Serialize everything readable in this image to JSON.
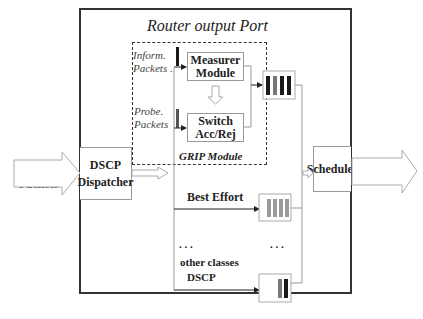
{
  "title": "Router output Port",
  "grip_module_label": "GRIP Module",
  "incoming": {
    "line1": "Incoming",
    "line2": "Packets"
  },
  "dispatcher": {
    "line1": "DSCP",
    "line2": "Dispatcher"
  },
  "measurer": {
    "line1": "Measurer",
    "line2": "Module"
  },
  "switch": {
    "line1": "Switch",
    "line2": "Acc/Rej"
  },
  "inform_packets": {
    "line1": "Inform.",
    "line2": "Packets ."
  },
  "probe_packets": {
    "line1": "Probe.",
    "line2": "Packets"
  },
  "scheduler": "Scheduler",
  "best_effort": "Best Effort",
  "ellipsis_left": ". . .",
  "ellipsis_right": ". . .",
  "other_classes": {
    "line1": "other classes",
    "line2": "DSCP"
  },
  "colors": {
    "queue_dark": "#1a1a1a",
    "queue_gray": "#777777",
    "queue_light": "#9a9a9a",
    "frame": "#333333",
    "thin_line": "#999999"
  }
}
